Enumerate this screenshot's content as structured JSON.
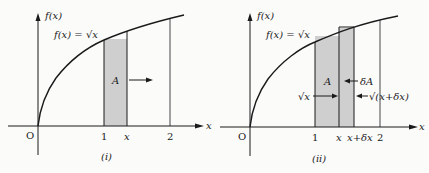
{
  "colors": {
    "ink": "#1a1a1a",
    "shade": "#cfcfcf",
    "background": "#fbfbfa"
  },
  "panels": [
    {
      "id": "i",
      "caption": "(i)",
      "y_axis_label": "f(x)",
      "x_axis_label": "x",
      "origin_label": "O",
      "curve_label": "f(x) = √x",
      "area_label": "A",
      "ticks": [
        "1",
        "x",
        "2"
      ],
      "annotations": []
    },
    {
      "id": "ii",
      "caption": "(ii)",
      "y_axis_label": "f(x)",
      "x_axis_label": "x",
      "origin_label": "O",
      "curve_label": "f(x) = √x",
      "area_label": "A",
      "ticks": [
        "1",
        "x",
        "x+δx",
        "2"
      ],
      "annotations": [
        "δA",
        "√x",
        "√(x+δx)"
      ]
    }
  ]
}
